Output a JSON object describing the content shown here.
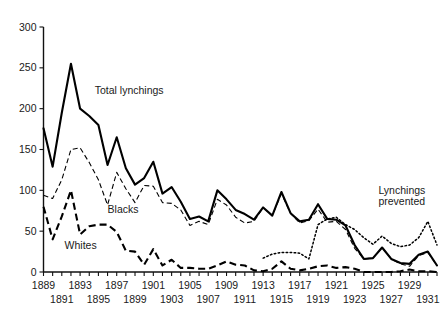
{
  "chart_data": {
    "type": "line",
    "title": "",
    "xlabel": "",
    "ylabel": "",
    "xlim": [
      1889,
      1932
    ],
    "ylim": [
      0,
      300
    ],
    "yticks": [
      0,
      50,
      100,
      150,
      200,
      250,
      300
    ],
    "grid": false,
    "legend_position": "inline-annotations",
    "x": [
      1889,
      1890,
      1891,
      1892,
      1893,
      1894,
      1895,
      1896,
      1897,
      1898,
      1899,
      1900,
      1901,
      1902,
      1903,
      1904,
      1905,
      1906,
      1907,
      1908,
      1909,
      1910,
      1911,
      1912,
      1913,
      1914,
      1915,
      1916,
      1917,
      1918,
      1919,
      1920,
      1921,
      1922,
      1923,
      1924,
      1925,
      1926,
      1927,
      1928,
      1929,
      1930,
      1931,
      1932
    ],
    "series": [
      {
        "name": "Total lynchings",
        "style": "solid-thick",
        "values": [
          176,
          129,
          195,
          255,
          200,
          191,
          180,
          131,
          165,
          127,
          107,
          115,
          135,
          96,
          104,
          86,
          65,
          68,
          62,
          100,
          89,
          76,
          71,
          64,
          79,
          69,
          98,
          72,
          62,
          64,
          83,
          65,
          64,
          57,
          33,
          16,
          17,
          30,
          16,
          11,
          10,
          21,
          25,
          8
        ]
      },
      {
        "name": "Blacks",
        "style": "dashed-thin",
        "values": [
          94,
          90,
          113,
          150,
          152,
          134,
          113,
          82,
          122,
          102,
          85,
          106,
          105,
          85,
          84,
          76,
          57,
          62,
          58,
          89,
          82,
          67,
          60,
          62,
          79,
          69,
          96,
          72,
          60,
          63,
          77,
          61,
          62,
          52,
          29,
          16,
          17,
          30,
          16,
          10,
          7,
          20,
          24,
          8
        ]
      },
      {
        "name": "Whites",
        "style": "dashed-thick",
        "values": [
          80,
          40,
          68,
          100,
          46,
          56,
          58,
          58,
          49,
          26,
          25,
          9,
          28,
          8,
          15,
          5,
          5,
          4,
          4,
          8,
          13,
          9,
          8,
          2,
          1,
          4,
          13,
          4,
          2,
          4,
          7,
          8,
          5,
          6,
          4,
          0,
          0,
          0,
          0,
          1,
          3,
          1,
          1,
          0
        ]
      },
      {
        "name": "Lynchings prevented",
        "style": "dotted",
        "values": [
          null,
          null,
          null,
          null,
          null,
          null,
          null,
          null,
          null,
          null,
          null,
          null,
          null,
          null,
          null,
          null,
          null,
          null,
          null,
          null,
          null,
          null,
          null,
          null,
          17,
          22,
          24,
          24,
          23,
          16,
          58,
          65,
          67,
          58,
          52,
          42,
          34,
          44,
          35,
          31,
          33,
          42,
          62,
          33
        ]
      }
    ],
    "annotations": [
      {
        "name": "total-lynchings-label",
        "text": "Total lynchings",
        "x": 1894.6,
        "y": 218
      },
      {
        "name": "blacks-label",
        "text": "Blacks",
        "x": 1896.0,
        "y": 72
      },
      {
        "name": "whites-label",
        "text": "Whites",
        "x": 1891.3,
        "y": 28
      },
      {
        "name": "lynchings-prevented-label-line1",
        "text": "Lynchings",
        "x": 1925.6,
        "y": 96
      },
      {
        "name": "lynchings-prevented-label-line2",
        "text": "prevented",
        "x": 1925.6,
        "y": 82
      }
    ],
    "xtick_labels_top_row": [
      1889,
      1893,
      1897,
      1901,
      1905,
      1909,
      1913,
      1917,
      1921,
      1925,
      1929
    ],
    "xtick_labels_bottom_row": [
      1891,
      1895,
      1899,
      1903,
      1907,
      1911,
      1915,
      1919,
      1923,
      1927,
      1931
    ],
    "ytick_labels": [
      "0",
      "50",
      "100",
      "150",
      "200",
      "250",
      "300"
    ],
    "colors": {
      "ink": "#000000",
      "background": "#ffffff"
    }
  }
}
